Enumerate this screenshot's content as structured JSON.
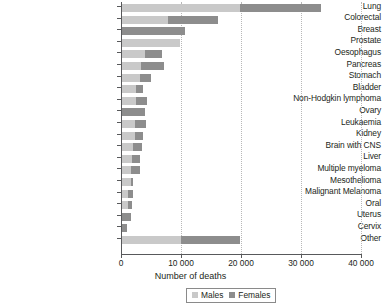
{
  "chart_data": {
    "type": "bar",
    "orientation": "horizontal",
    "stacked": true,
    "title": "",
    "xlabel": "Number of deaths",
    "ylabel": "",
    "xlim": [
      0,
      40000
    ],
    "xticks": [
      0,
      10000,
      20000,
      30000,
      40000
    ],
    "xticklabels": [
      "0",
      "10 000",
      "20 000",
      "30 000",
      "40 000"
    ],
    "grid": "vertical-dotted",
    "legend_position": "bottom-center",
    "categories": [
      "Lung",
      "Colorectal",
      "Breast",
      "Prostate",
      "Oesophagus",
      "Pancreas",
      "Stomach",
      "Bladder",
      "Non-Hodgkin lymphoma",
      "Ovary",
      "Leukaemia",
      "Kidney",
      "Brain with CNS",
      "Liver",
      "Multiple myeloma",
      "Mesothelioma",
      "Malignant Melanoma",
      "Oral",
      "Uterus",
      "Cervix",
      "Other"
    ],
    "series": [
      {
        "name": "Males",
        "color": "#c9c9c9",
        "values": [
          19800,
          7800,
          100,
          9800,
          4000,
          3400,
          3200,
          2500,
          2500,
          0,
          2400,
          2300,
          2000,
          1800,
          1700,
          1600,
          1100,
          1200,
          0,
          0,
          10000
        ]
      },
      {
        "name": "Females",
        "color": "#8d8d8d",
        "values": [
          13500,
          8400,
          10500,
          0,
          2900,
          3700,
          1800,
          1200,
          1900,
          4000,
          1800,
          1300,
          1500,
          1300,
          1400,
          400,
          900,
          600,
          1600,
          1000,
          9800
        ]
      }
    ],
    "totals": [
      33300,
      16200,
      10600,
      9800,
      6900,
      7100,
      5000,
      3700,
      4400,
      4000,
      4200,
      3600,
      3500,
      3100,
      3100,
      2000,
      2000,
      1800,
      1600,
      1000,
      19800
    ]
  },
  "legend": {
    "items": [
      {
        "label": "Males",
        "color": "#c9c9c9"
      },
      {
        "label": "Females",
        "color": "#8d8d8d"
      }
    ]
  },
  "axis": {
    "x_title": "Number of deaths"
  }
}
